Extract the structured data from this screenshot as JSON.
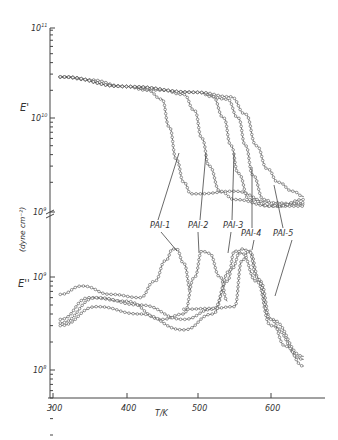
{
  "chart_data": [
    {
      "type": "line",
      "title": "",
      "panel": "upper",
      "ylabel": "E' (dyne cm^-2)",
      "xlabel": "T/K",
      "yscale": "log",
      "ylim": [
        1000000000.0,
        100000000000.0
      ],
      "yticks": [
        "10^9",
        "10^10",
        "10^11"
      ],
      "xlim": [
        300,
        650
      ],
      "series": [
        {
          "name": "PAI-1",
          "x": [
            310,
            350,
            400,
            430,
            450,
            460,
            470,
            480,
            490,
            500,
            550,
            600,
            645
          ],
          "y": [
            28000000000.0,
            26000000000.0,
            22000000000.0,
            20000000000.0,
            16000000000.0,
            8000000000.0,
            3500000000.0,
            2000000000.0,
            1500000000.0,
            1500000000.0,
            1600000000.0,
            1200000000.0,
            1150000000.0
          ]
        },
        {
          "name": "PAI-2",
          "x": [
            310,
            400,
            450,
            480,
            495,
            505,
            515,
            530,
            550,
            600,
            645
          ],
          "y": [
            28000000000.0,
            22000000000.0,
            20000000000.0,
            18000000000.0,
            12000000000.0,
            6000000000.0,
            3000000000.0,
            1600000000.0,
            1300000000.0,
            1100000000.0,
            1100000000.0
          ]
        },
        {
          "name": "PAI-3",
          "x": [
            310,
            400,
            500,
            520,
            535,
            545,
            555,
            570,
            600,
            645
          ],
          "y": [
            28000000000.0,
            22000000000.0,
            19000000000.0,
            17000000000.0,
            10000000000.0,
            5000000000.0,
            2500000000.0,
            1300000000.0,
            1100000000.0,
            1200000000.0
          ]
        },
        {
          "name": "PAI-4",
          "x": [
            310,
            400,
            500,
            540,
            555,
            565,
            575,
            590,
            610,
            645
          ],
          "y": [
            28000000000.0,
            22000000000.0,
            19000000000.0,
            16000000000.0,
            10000000000.0,
            5000000000.0,
            2400000000.0,
            1300000000.0,
            1100000000.0,
            1300000000.0
          ]
        },
        {
          "name": "PAI-5",
          "x": [
            310,
            400,
            500,
            545,
            565,
            580,
            595,
            610,
            630,
            645
          ],
          "y": [
            28000000000.0,
            22000000000.0,
            19000000000.0,
            17000000000.0,
            11000000000.0,
            5000000000.0,
            2800000000.0,
            2000000000.0,
            1600000000.0,
            1400000000.0
          ]
        }
      ],
      "annotations": [
        "PAI-1",
        "PAI-2",
        "PAI-3",
        "PAI-4",
        "PAI-5"
      ]
    },
    {
      "type": "line",
      "title": "",
      "panel": "lower",
      "ylabel": "E'' (dyne cm^-2)",
      "xlabel": "T/K",
      "yscale": "log",
      "ylim": [
        50000000.0,
        2000000000.0
      ],
      "yticks": [
        "10^8",
        "10^9"
      ],
      "xlim": [
        300,
        650
      ],
      "xticks": [
        300,
        400,
        500,
        600
      ],
      "series": [
        {
          "name": "PAI-1",
          "x": [
            310,
            340,
            380,
            420,
            440,
            455,
            465,
            470,
            480,
            490
          ],
          "y": [
            650000000.0,
            800000000.0,
            650000000.0,
            600000000.0,
            900000000.0,
            1500000000.0,
            2000000000.0,
            2000000000.0,
            1400000000.0,
            700000000.0
          ]
        },
        {
          "name": "PAI-2",
          "x": [
            310,
            350,
            400,
            450,
            480,
            495,
            505,
            515,
            530,
            540
          ],
          "y": [
            350000000.0,
            600000000.0,
            550000000.0,
            350000000.0,
            400000000.0,
            1000000000.0,
            1900000000.0,
            1800000000.0,
            1000000000.0,
            550000000.0
          ]
        },
        {
          "name": "PAI-3",
          "x": [
            310,
            360,
            420,
            480,
            520,
            540,
            550,
            560,
            580,
            600,
            645
          ],
          "y": [
            300000000.0,
            480000000.0,
            400000000.0,
            270000000.0,
            400000000.0,
            900000000.0,
            1900000000.0,
            1800000000.0,
            900000000.0,
            300000000.0,
            130000000.0
          ]
        },
        {
          "name": "PAI-4",
          "x": [
            310,
            360,
            420,
            480,
            520,
            545,
            560,
            570,
            585,
            600,
            645
          ],
          "y": [
            320000000.0,
            600000000.0,
            500000000.0,
            350000000.0,
            450000000.0,
            1200000000.0,
            2000000000.0,
            1900000000.0,
            900000000.0,
            350000000.0,
            140000000.0
          ]
        },
        {
          "name": "PAI-5",
          "x": [
            480,
            520,
            550,
            560,
            570,
            580,
            600,
            620,
            645
          ],
          "y": [
            450000000.0,
            460000000.0,
            480000000.0,
            1500000000.0,
            1900000000.0,
            1000000000.0,
            350000000.0,
            180000000.0,
            110000000.0
          ]
        }
      ],
      "annotations": [
        "PAI-1",
        "PAI-2",
        "PAI-3",
        "PAI-4",
        "PAI-5"
      ]
    }
  ],
  "axes": {
    "upper_ylabel": "E'",
    "lower_ylabel": "E''",
    "units_label": "(dyne cm⁻²)",
    "xlabel": "T/K",
    "yticks_upper": [
      {
        "label": "10",
        "exp": "11"
      },
      {
        "label": "10",
        "exp": "10"
      },
      {
        "label": "10",
        "exp": "9"
      }
    ],
    "yticks_lower": [
      {
        "label": "10",
        "exp": "9"
      },
      {
        "label": "10",
        "exp": "8"
      }
    ],
    "xticks": [
      "300",
      "400",
      "500",
      "600"
    ]
  },
  "labels": [
    "PAI-1",
    "PAI-2",
    "PAI-3",
    "PAI-4",
    "PAI-5"
  ]
}
